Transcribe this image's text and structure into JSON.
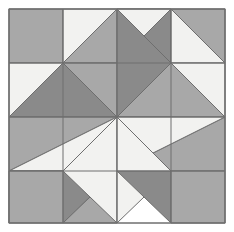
{
  "figure": {
    "kind": "quilt-block-diagram",
    "background": "#ffffff",
    "canvas": {
      "width": 234,
      "height": 232
    }
  },
  "block": {
    "origin_x": 9,
    "origin_y": 9,
    "cell": 54,
    "columns": 4,
    "rows": 4,
    "width": 216,
    "height": 214,
    "outline_color": "#6e6e6e",
    "outline_width": 1
  },
  "palette": {
    "light": "#f2f2f0",
    "medium": "#a8a8a8",
    "dark": "#8a8a8a",
    "outline": "#6e6e6e",
    "background": "#ffffff"
  },
  "legend": {
    "light_label": "Light",
    "medium_label": "Medium",
    "dark_label": "Dark"
  },
  "patches": [
    {
      "name": "corner-top-left-square",
      "tone": "medium",
      "points": "9,9 63,9 63,63 9,63"
    },
    {
      "name": "r0c1-upper-light",
      "tone": "light",
      "points": "63,9 117,9 63,63"
    },
    {
      "name": "r0c1-lower-light",
      "tone": "light",
      "points": "63,63 117,9 117,63"
    },
    {
      "name": "r0c1-medium-wedge",
      "tone": "medium",
      "points": "63,63 117,9 117,63"
    },
    {
      "name": "r0c2-light-left",
      "tone": "light",
      "points": "117,9 117,63 63,63"
    },
    {
      "name": "star-point-top-left-light",
      "tone": "light",
      "points": "117,9 117,117 63,63"
    },
    {
      "name": "star-point-top-right-light",
      "tone": "light",
      "points": "117,9 117,117 171,63"
    },
    {
      "name": "r0c2-dark-triangle",
      "tone": "dark",
      "points": "117,9 171,9 171,63"
    },
    {
      "name": "r0c3-light-triangle",
      "tone": "light",
      "points": "117,9 171,9 117,63"
    },
    {
      "name": "corner-top-right-square",
      "tone": "medium",
      "points": "171,9 225,9 225,63 171,63"
    },
    {
      "name": "r1c0-light-upper",
      "tone": "light",
      "points": "9,63 63,63 9,117"
    },
    {
      "name": "r1c0-dark-triangle",
      "tone": "dark",
      "points": "9,117 63,63 117,117"
    },
    {
      "name": "r1c1-medium-upper",
      "tone": "medium",
      "points": "63,63 117,9 117,63"
    },
    {
      "name": "r1c1-medium-lower",
      "tone": "medium",
      "points": "63,63 117,63 117,117"
    },
    {
      "name": "r1c2-dark-upper",
      "tone": "dark",
      "points": "117,9 171,63 117,117"
    },
    {
      "name": "r1c2-medium-right",
      "tone": "medium",
      "points": "171,63 225,117 117,117"
    },
    {
      "name": "r1c3-light-upper",
      "tone": "light",
      "points": "171,9 225,63 171,63"
    },
    {
      "name": "r1c3-light-lower",
      "tone": "light",
      "points": "171,63 225,63 225,117"
    },
    {
      "name": "center-square",
      "tone": "medium",
      "points": "117,117 171,117 171,171 117,171"
    },
    {
      "name": "r2c0-medium-band",
      "tone": "medium",
      "points": "9,117 117,117 9,171"
    },
    {
      "name": "r2c0-light-band",
      "tone": "light",
      "points": "9,171 117,117 117,171"
    },
    {
      "name": "r2c3-medium-band",
      "tone": "medium",
      "points": "117,171 225,117 225,171"
    },
    {
      "name": "r2c3-light-band",
      "tone": "light",
      "points": "117,117 117,171 225,117"
    },
    {
      "name": "r3c0-light-lower",
      "tone": "light",
      "points": "9,171 63,171 9,223"
    },
    {
      "name": "r3c0-dark-triangle",
      "tone": "dark",
      "points": "9,171 117,171 63,223"
    },
    {
      "name": "corner-bottom-left-square",
      "tone": "medium",
      "points": "9,171 63,171 63,223 9,223"
    },
    {
      "name": "r3c1-medium-lower",
      "tone": "medium",
      "points": "63,223 117,171 117,223"
    },
    {
      "name": "star-point-bottom-left-light",
      "tone": "light",
      "points": "117,223 117,117 63,171"
    },
    {
      "name": "star-point-bottom-right-light",
      "tone": "light",
      "points": "117,223 117,117 171,171"
    },
    {
      "name": "r3c2-dark-triangle",
      "tone": "dark",
      "points": "117,171 171,171 171,223"
    },
    {
      "name": "corner-bottom-right-square",
      "tone": "medium",
      "points": "171,171 225,171 225,223 171,223"
    }
  ],
  "geometry": {
    "quadrants": [
      {
        "name": "top-left",
        "corner_square": "medium",
        "dark_triangle": "down-left",
        "light_wedge": "inner"
      },
      {
        "name": "top-right",
        "corner_square": "medium",
        "dark_triangle": "down-right",
        "light_wedge": "inner"
      },
      {
        "name": "bottom-left",
        "corner_square": "medium",
        "dark_triangle": "up-left",
        "light_wedge": "inner"
      },
      {
        "name": "bottom-right",
        "corner_square": "medium",
        "dark_triangle": "up-right",
        "light_wedge": "inner"
      }
    ],
    "symmetry": "180-degree rotational",
    "grid_lines_x": [
      9,
      63,
      117,
      171,
      225
    ],
    "grid_lines_y": [
      9,
      63,
      117,
      171,
      223
    ]
  }
}
